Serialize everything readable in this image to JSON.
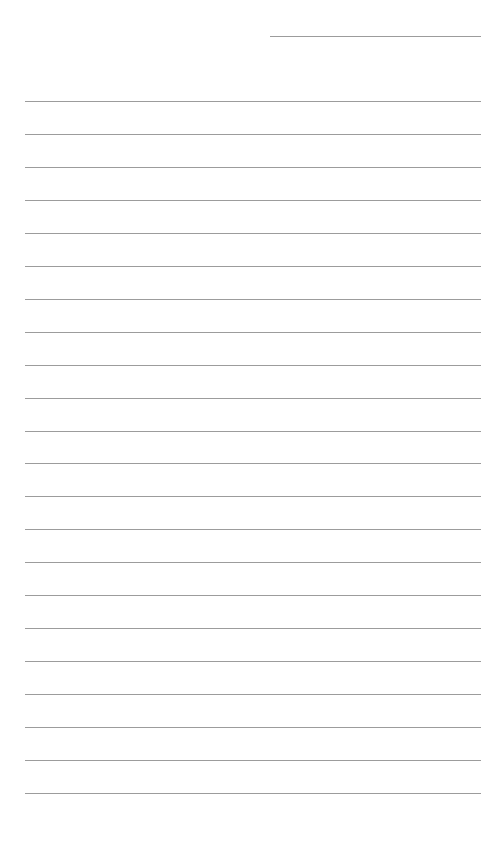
{
  "page": {
    "type": "lined-paper",
    "background": "#ffffff",
    "line_color": "#9c9c9c"
  },
  "date_line": {
    "left": 270,
    "right": 481,
    "y": 36
  },
  "rules": {
    "left": 25,
    "right": 481,
    "first_y": 101,
    "spacing": 32.95,
    "count": 22
  }
}
